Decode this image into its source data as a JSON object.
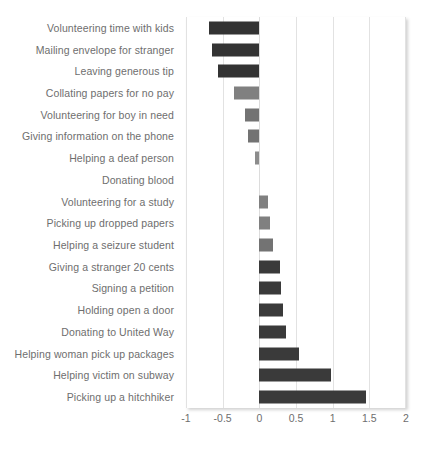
{
  "chart_data": {
    "type": "bar",
    "orientation": "horizontal",
    "title": "",
    "subtitle": "",
    "xlabel": "",
    "ylabel": "",
    "xlim": [
      -1,
      2
    ],
    "ylim": null,
    "grid": true,
    "legend": false,
    "legend_position": "none",
    "xticks": [
      -1,
      -0.5,
      0,
      0.5,
      1,
      1.5,
      2
    ],
    "xticklabels": [
      "-1",
      "-0.5",
      "0",
      "0.5",
      "1",
      "1.5",
      "2"
    ],
    "categories": [
      "Volunteering time with kids",
      "Mailing envelope for stranger",
      "Leaving generous tip",
      "Collating papers for no pay",
      "Volunteering for boy in need",
      "Giving information on the phone",
      "Helping a deaf person",
      "Donating blood",
      "Volunteering for a study",
      "Picking up dropped papers",
      "Helping a seizure student",
      "Giving a stranger 20 cents",
      "Signing a petition",
      "Holding open a door",
      "Donating to United Way",
      "Helping woman pick up packages",
      "Helping victim on subway",
      "Picking up a hitchhiker"
    ],
    "values": [
      -0.68,
      -0.64,
      -0.56,
      -0.34,
      -0.2,
      -0.16,
      -0.06,
      0.0,
      0.12,
      0.15,
      0.18,
      0.28,
      0.3,
      0.32,
      0.37,
      0.54,
      0.98,
      1.46
    ],
    "bar_colors": [
      "#333333",
      "#333333",
      "#333333",
      "#808080",
      "#737373",
      "#737373",
      "#8c8c8c",
      "#808080",
      "#808080",
      "#808080",
      "#737373",
      "#3a3a3a",
      "#3a3a3a",
      "#3a3a3a",
      "#3a3a3a",
      "#3a3a3a",
      "#3a3a3a",
      "#3a3a3a"
    ]
  },
  "style": {
    "grid_color": "#e2e2e2",
    "axis_text_color": "#6e6e6e",
    "plot_background": "#ffffff",
    "dark_bar_color": "#333333",
    "light_bar_color": "#808080"
  }
}
